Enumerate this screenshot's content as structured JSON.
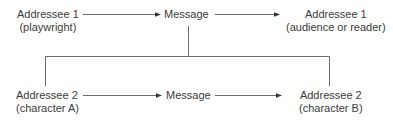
{
  "diagram": {
    "top_row": {
      "source": {
        "line1": "Addressee 1",
        "line2": "(playwright)"
      },
      "message": "Message",
      "target": {
        "line1": "Addressee 1",
        "line2": "(audience or reader)"
      }
    },
    "bottom_row": {
      "source": {
        "line1": "Addressee 2",
        "line2": "(character A)"
      },
      "message": "Message",
      "target": {
        "line1": "Addressee 2",
        "line2": "(character B)"
      }
    },
    "line_color": "#6e6e6e",
    "text_color": "#3a3a3a"
  }
}
